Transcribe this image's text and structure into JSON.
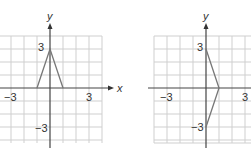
{
  "figures": [
    {
      "id": "graph-left",
      "axis_labels": {
        "x": "x",
        "y": "y"
      },
      "tick_labels": {
        "x_neg": "−3",
        "x_pos": "3",
        "y_pos": "3",
        "y_neg": "−3"
      },
      "grid": {
        "x_range": [
          -3,
          4
        ],
        "y_range": [
          -4,
          4
        ]
      },
      "polyline": [
        [
          -1,
          0
        ],
        [
          0,
          3
        ],
        [
          1,
          0
        ]
      ],
      "line_color": "#777777"
    },
    {
      "id": "graph-right",
      "axis_labels": {
        "x": "x",
        "y": "y"
      },
      "tick_labels": {
        "x_neg": "−3",
        "x_pos": "3",
        "y_pos": "3",
        "y_neg": "−3"
      },
      "grid": {
        "x_range": [
          -4,
          3
        ],
        "y_range": [
          -4,
          4
        ]
      },
      "polyline": [
        [
          0,
          3
        ],
        [
          1,
          0
        ],
        [
          0,
          -3
        ]
      ],
      "line_color": "#777777"
    }
  ]
}
